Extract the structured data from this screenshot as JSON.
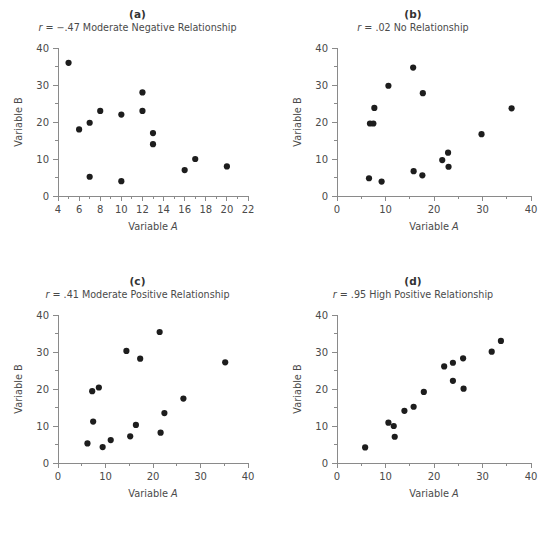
{
  "figure": {
    "background": "#ffffff",
    "point_color": "#1d1d1d",
    "axis_color": "#8a8a8a",
    "text_color": "#4a4a4a"
  },
  "panels": [
    {
      "letter": "(a)",
      "caption_r": "r",
      "caption_rest": " = −.47 Moderate Negative Relationship",
      "caption_full": "r = −.47 Moderate Negative Relationship",
      "xlabel_prefix": "Variable ",
      "xlabel_var": "A",
      "ylabel_prefix": "Variable ",
      "ylabel_var": "B",
      "xticks": [
        "4",
        "6",
        "8",
        "10",
        "12",
        "14",
        "16",
        "18",
        "20",
        "22"
      ],
      "yticks": [
        "0",
        "10",
        "20",
        "30",
        "40"
      ]
    },
    {
      "letter": "(b)",
      "caption_r": "r",
      "caption_rest": " = .02 No Relationship",
      "caption_full": "r = .02 No Relationship",
      "xlabel_prefix": "Variable ",
      "xlabel_var": "A",
      "ylabel_prefix": "Variable ",
      "ylabel_var": "B",
      "xticks": [
        "0",
        "10",
        "20",
        "30",
        "40"
      ],
      "yticks": [
        "0",
        "10",
        "20",
        "30",
        "40"
      ]
    },
    {
      "letter": "(c)",
      "caption_r": "r",
      "caption_rest": " = .41 Moderate Positive Relationship",
      "caption_full": "r = .41 Moderate Positive Relationship",
      "xlabel_prefix": "Variable ",
      "xlabel_var": "A",
      "ylabel_prefix": "Variable ",
      "ylabel_var": "B",
      "xticks": [
        "0",
        "10",
        "20",
        "30",
        "40"
      ],
      "yticks": [
        "0",
        "10",
        "20",
        "30",
        "40"
      ]
    },
    {
      "letter": "(d)",
      "caption_r": "r",
      "caption_rest": " = .95 High Positive Relationship",
      "caption_full": "r = .95 High Positive Relationship",
      "xlabel_prefix": "Variable ",
      "xlabel_var": "A",
      "ylabel_prefix": "Variable ",
      "ylabel_var": "B",
      "xticks": [
        "0",
        "10",
        "20",
        "30",
        "40"
      ],
      "yticks": [
        "0",
        "10",
        "20",
        "30",
        "40"
      ]
    }
  ],
  "chart_data": [
    {
      "type": "scatter",
      "panel": "(a)",
      "title": "r = −.47 Moderate Negative Relationship",
      "correlation": -0.47,
      "xlabel": "Variable A",
      "ylabel": "Variable B",
      "xlim": [
        4,
        22
      ],
      "ylim": [
        0,
        40
      ],
      "xticks": [
        4,
        6,
        8,
        10,
        12,
        14,
        16,
        18,
        20,
        22
      ],
      "yticks": [
        0,
        10,
        20,
        30,
        40
      ],
      "x_minor_step": 1,
      "y_minor_step": 5,
      "grid": false,
      "legend": null,
      "x": [
        5,
        6,
        7,
        7,
        8,
        10,
        10,
        12,
        12,
        13,
        13,
        16,
        17,
        20
      ],
      "y": [
        36,
        18,
        19.8,
        5.2,
        23,
        22,
        4,
        28,
        23,
        17,
        14,
        7,
        10,
        8
      ]
    },
    {
      "type": "scatter",
      "panel": "(b)",
      "title": "r = .02 No Relationship",
      "correlation": 0.02,
      "xlabel": "Variable A",
      "ylabel": "Variable B",
      "xlim": [
        0,
        40
      ],
      "ylim": [
        0,
        40
      ],
      "xticks": [
        0,
        10,
        20,
        30,
        40
      ],
      "yticks": [
        0,
        10,
        20,
        30,
        40
      ],
      "x_minor_step": 5,
      "y_minor_step": 5,
      "grid": false,
      "legend": null,
      "x": [
        6.6,
        6.8,
        7.5,
        7.7,
        9.2,
        10.6,
        15.7,
        15.8,
        17.6,
        17.7,
        21.7,
        22.9,
        23.0,
        29.8,
        36.0
      ],
      "y": [
        4.8,
        19.6,
        19.6,
        23.8,
        3.9,
        29.8,
        34.7,
        6.7,
        5.6,
        27.8,
        9.7,
        11.7,
        7.9,
        16.7,
        23.7
      ]
    },
    {
      "type": "scatter",
      "panel": "(c)",
      "title": "r = .41 Moderate Positive Relationship",
      "correlation": 0.41,
      "xlabel": "Variable A",
      "ylabel": "Variable B",
      "xlim": [
        0,
        40
      ],
      "ylim": [
        0,
        40
      ],
      "xticks": [
        0,
        10,
        20,
        30,
        40
      ],
      "yticks": [
        0,
        10,
        20,
        30,
        40
      ],
      "x_minor_step": 5,
      "y_minor_step": 5,
      "grid": false,
      "legend": null,
      "x": [
        6.2,
        7.2,
        7.4,
        8.6,
        9.4,
        11.1,
        14.4,
        15.2,
        16.4,
        17.3,
        21.4,
        21.6,
        22.4,
        26.4,
        35.2
      ],
      "y": [
        5.3,
        19.4,
        11.2,
        20.4,
        4.3,
        6.2,
        30.3,
        7.2,
        10.3,
        28.2,
        35.4,
        8.2,
        13.5,
        17.4,
        27.2
      ]
    },
    {
      "type": "scatter",
      "panel": "(d)",
      "title": "r = .95 High Positive Relationship",
      "correlation": 0.95,
      "xlabel": "Variable A",
      "ylabel": "Variable B",
      "xlim": [
        0,
        40
      ],
      "ylim": [
        0,
        40
      ],
      "xticks": [
        0,
        10,
        20,
        30,
        40
      ],
      "yticks": [
        0,
        10,
        20,
        30,
        40
      ],
      "x_minor_step": 5,
      "y_minor_step": 5,
      "grid": false,
      "legend": null,
      "x": [
        5.8,
        10.6,
        11.7,
        11.9,
        13.9,
        15.8,
        17.9,
        22.1,
        23.9,
        23.9,
        26.0,
        26.1,
        31.9,
        33.8
      ],
      "y": [
        4.2,
        10.9,
        10.0,
        7.1,
        14.1,
        15.2,
        19.2,
        26.1,
        27.1,
        22.2,
        28.3,
        20.1,
        30.1,
        33.0
      ]
    }
  ]
}
